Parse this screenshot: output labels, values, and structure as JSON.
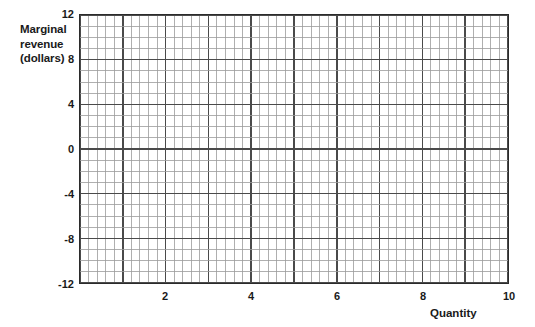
{
  "chart_data": {
    "type": "line",
    "title": "",
    "subtitle": "",
    "xlabel": "Quantity",
    "ylabel": "Marginal revenue (dollars)",
    "ylabel_lines": [
      "Marginal",
      "revenue",
      "(dollars)"
    ],
    "xlim": [
      0,
      10
    ],
    "ylim": [
      -12,
      12
    ],
    "x_ticks": [
      2,
      4,
      6,
      8,
      10
    ],
    "x_tick_labels": [
      "2",
      "4",
      "6",
      "8",
      "10"
    ],
    "y_ticks": [
      12,
      8,
      4,
      0,
      -4,
      -8,
      -12
    ],
    "y_tick_labels": [
      "12",
      "8",
      "4",
      "0",
      "-4",
      "-8",
      "-12"
    ],
    "grid": true,
    "grid_minor": true,
    "x_minor_divisions": 50,
    "y_minor_divisions": 24,
    "x_major_every_minor": 5,
    "y_major_every_minor": 4,
    "legend": null,
    "series": [],
    "annotations": [],
    "colors": {
      "background": "#ffffff",
      "frame": "#2b2b2b",
      "grid_minor": "#9a9a9a",
      "grid_major": "#4a4a4a",
      "text": "#1a1a1a"
    }
  },
  "axes": {
    "y_title": {
      "line1": "Marginal",
      "line2": "revenue",
      "line3": "(dollars)"
    },
    "x_title": "Quantity"
  }
}
